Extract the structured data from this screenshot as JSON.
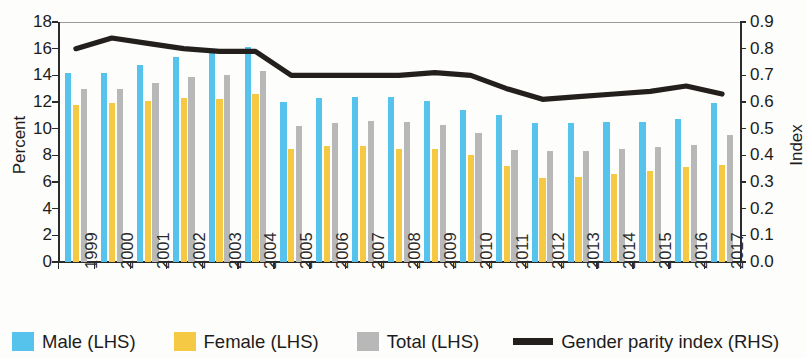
{
  "axes": {
    "left_title": "Percent",
    "right_title": "Index",
    "left_ticks": [
      "0",
      "2",
      "4",
      "6",
      "8",
      "10",
      "12",
      "14",
      "16",
      "18"
    ],
    "right_ticks": [
      "0.0",
      "0.1",
      "0.2",
      "0.3",
      "0.4",
      "0.5",
      "0.6",
      "0.7",
      "0.8",
      "0.9"
    ]
  },
  "legend": {
    "male": "Male (LHS)",
    "female": "Female (LHS)",
    "total": "Total (LHS)",
    "gpi": "Gender parity index (RHS)"
  },
  "colors": {
    "male": "#55c3ec",
    "female": "#f6c944",
    "total": "#b8b8b8",
    "gpi": "#231f1c"
  },
  "chart_data": {
    "type": "bar",
    "title": "",
    "subtitle": "",
    "xlabel": "",
    "ylabel": "Percent",
    "y2label": "Index",
    "ylim": [
      0,
      18
    ],
    "y2lim": [
      0,
      0.9
    ],
    "ytick_step": 2,
    "y2tick_step": 0.1,
    "grid": false,
    "legend_position": "bottom",
    "categories": [
      "1999",
      "2000",
      "2001",
      "2002",
      "2003",
      "2004",
      "2005",
      "2006",
      "2007",
      "2008",
      "2009",
      "2010",
      "2011",
      "2012",
      "2013",
      "2014",
      "2015",
      "2016",
      "2017"
    ],
    "series": [
      {
        "name": "Male (LHS)",
        "axis": "left",
        "type": "bar",
        "color": "#55c3ec",
        "values": [
          14.2,
          14.2,
          14.8,
          15.4,
          15.7,
          16.1,
          12.0,
          12.3,
          12.4,
          12.4,
          12.1,
          11.4,
          11.0,
          10.4,
          10.4,
          10.5,
          10.5,
          10.7,
          11.9
        ]
      },
      {
        "name": "Female (LHS)",
        "axis": "left",
        "type": "bar",
        "color": "#f6c944",
        "values": [
          11.8,
          11.9,
          12.1,
          12.3,
          12.2,
          12.6,
          8.5,
          8.7,
          8.7,
          8.5,
          8.5,
          8.0,
          7.2,
          6.3,
          6.4,
          6.6,
          6.8,
          7.1,
          7.3
        ]
      },
      {
        "name": "Total (LHS)",
        "axis": "left",
        "type": "bar",
        "color": "#b8b8b8",
        "values": [
          13.0,
          13.0,
          13.4,
          13.9,
          14.0,
          14.3,
          10.2,
          10.4,
          10.6,
          10.5,
          10.3,
          9.7,
          8.4,
          8.3,
          8.3,
          8.5,
          8.6,
          8.8,
          9.5
        ]
      },
      {
        "name": "Gender parity index (RHS)",
        "axis": "right",
        "type": "line",
        "color": "#231f1c",
        "values": [
          0.8,
          0.84,
          0.82,
          0.8,
          0.79,
          0.79,
          0.7,
          0.7,
          0.7,
          0.7,
          0.71,
          0.7,
          0.65,
          0.61,
          0.62,
          0.63,
          0.64,
          0.66,
          0.63
        ]
      }
    ]
  }
}
